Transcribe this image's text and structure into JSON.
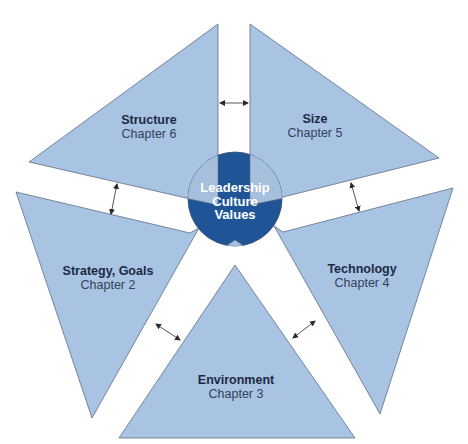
{
  "colors": {
    "panel_fill": "#a9c3e2",
    "panel_stroke": "#5d6f86",
    "core_fill": "#1f5596",
    "core_wedge": "#a5bfdc",
    "arrow": "#2a2a2a",
    "text": "#1c2a44"
  },
  "core": {
    "lines": [
      "Leadership",
      "Culture",
      "Values"
    ]
  },
  "panels": [
    {
      "id": "structure",
      "title": "Structure",
      "chapter": "Chapter 6"
    },
    {
      "id": "size",
      "title": "Size",
      "chapter": "Chapter 5"
    },
    {
      "id": "strategy",
      "title": "Strategy, Goals",
      "chapter": "Chapter 2"
    },
    {
      "id": "technology",
      "title": "Technology",
      "chapter": "Chapter 4"
    },
    {
      "id": "environment",
      "title": "Environment",
      "chapter": "Chapter 3"
    }
  ],
  "connectors": [
    {
      "between": [
        "structure",
        "size"
      ],
      "type": "double-arrow"
    },
    {
      "between": [
        "structure",
        "strategy"
      ],
      "type": "double-arrow"
    },
    {
      "between": [
        "size",
        "technology"
      ],
      "type": "double-arrow"
    },
    {
      "between": [
        "strategy",
        "environment"
      ],
      "type": "double-arrow"
    },
    {
      "between": [
        "technology",
        "environment"
      ],
      "type": "double-arrow"
    }
  ]
}
